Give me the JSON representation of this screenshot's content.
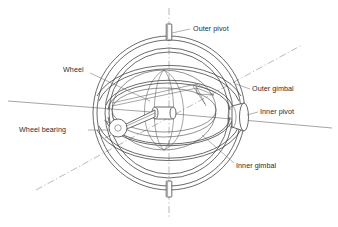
{
  "figure": {
    "kind": "engineering-line-drawing",
    "background_color": "#ffffff",
    "line_color": "#3a3a3a",
    "axis_color": "#8a8a8a",
    "text_color": "#2b2b2b"
  },
  "labels": {
    "outer_pivot": "Outer pivot",
    "outer_gimbal": "Outer gimbal",
    "inner_pivot": "Inner pivot",
    "inner_gimbal": "Inner gimbal",
    "wheel": "Wheel",
    "wheel_bearing": "Wheel bearing"
  },
  "parts": {
    "outer_pivot_top": "outer-pivot-pin-top",
    "outer_pivot_bottom": "outer-pivot-pin-bottom",
    "inner_pivot_boss": "inner-pivot-boss-right",
    "wheel_bearing_hub": "wheel-bearing-circle",
    "rotor_hub": "rotor-hub",
    "rotor_shaft": "rotor-shaft"
  },
  "axes": {
    "vertical": "outer gimbal spin axis (dash-dot, vertical)",
    "diagonal": "inner gimbal axis (dash-dot, lower-left to upper-right)",
    "horizontal": "rotor / inner pivot axis (solid, near-horizontal)"
  }
}
